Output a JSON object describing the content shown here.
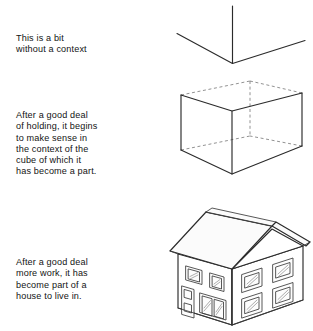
{
  "document": {
    "background_color": "#ffffff",
    "ink_color": "#2b2b2b",
    "hidden_edge_color": "#6d6d6d"
  },
  "captions": [
    {
      "id": "caption-1",
      "text": "This is a bit\nwithout a context"
    },
    {
      "id": "caption-2",
      "text": "After a good deal\nof holding, it begins\nto make sense in\nthe context of the\ncube of which it\nhas become a part."
    },
    {
      "id": "caption-3",
      "text": "After a good deal\nmore work, it has\nbecome part of a\nhouse to live in."
    }
  ],
  "figures": [
    {
      "id": "figure-corner",
      "name": "three-line-corner-fragment",
      "description": "Three straight lines meeting at a single vertex forming a Y shape"
    },
    {
      "id": "figure-cube",
      "name": "wireframe-cube",
      "description": "Transparent cube in perspective with dashed hidden edges"
    },
    {
      "id": "figure-house",
      "name": "perspective-house",
      "description": "Two-storey house in two-point perspective with gabled roof, door and windows"
    }
  ]
}
